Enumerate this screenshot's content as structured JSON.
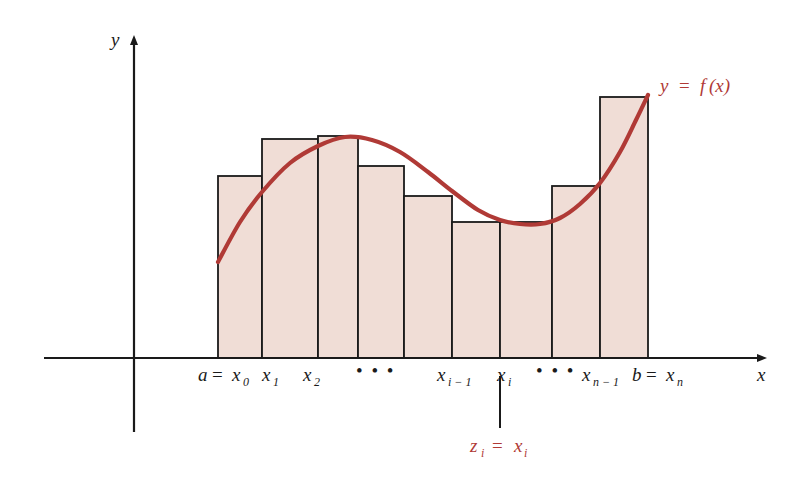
{
  "figure": {
    "axis_labels": {
      "x": "x",
      "y": "y"
    },
    "curve_label": {
      "y": "y",
      "equals": "=",
      "f": "f",
      "arg": "(x)"
    },
    "sample_point_label": {
      "z": "z",
      "z_sub": "i",
      "equals": "=",
      "x": "x",
      "x_sub": "i"
    },
    "tick_labels": [
      {
        "name": "a-equals-x0",
        "main": "a",
        "op": "=",
        "var": "x",
        "sub": "0",
        "x": 198
      },
      {
        "name": "x1",
        "main": "",
        "op": "",
        "var": "x",
        "sub": "1",
        "x": 262
      },
      {
        "name": "x2",
        "main": "",
        "op": "",
        "var": "x",
        "sub": "2",
        "x": 303
      },
      {
        "name": "ellipsis-left",
        "main": "",
        "op": "",
        "var": "",
        "sub": "",
        "x": 356
      },
      {
        "name": "xi-minus-1",
        "main": "",
        "op": "",
        "var": "x",
        "sub": "i − 1",
        "x": 437
      },
      {
        "name": "xi",
        "main": "",
        "op": "",
        "var": "x",
        "sub": "i",
        "x": 497
      },
      {
        "name": "ellipsis-right",
        "main": "",
        "op": "",
        "var": "",
        "sub": "",
        "x": 536
      },
      {
        "name": "xn-minus-1",
        "main": "",
        "op": "",
        "var": "x",
        "sub": "n − 1",
        "x": 582
      },
      {
        "name": "b-equals-xn",
        "main": "b",
        "op": "=",
        "var": "x",
        "sub": "n",
        "x": 632
      }
    ],
    "ellipsis_dots": "• • •",
    "colors": {
      "curve": "#b03a36",
      "rectangle_fill": "#f0ddd6",
      "rectangle_stroke": "#1a1a1a",
      "axis": "#1a1a1a",
      "annotation": "#b03a36"
    }
  },
  "chart_data": {
    "type": "bar",
    "title": "",
    "subtitle": "",
    "xlabel": "x",
    "ylabel": "y",
    "grid": false,
    "legend": null,
    "axis_origin": {
      "x": 134,
      "y": 358
    },
    "xlim": [
      134,
      770
    ],
    "ylim": [
      358,
      40
    ],
    "categories": [
      "x0 to x1",
      "x1 to x2",
      "x2 to x3",
      "x3 to x4",
      "x4 to x5",
      "xi-1 to xi",
      "xi to xi+1",
      "xn-2 to xn-1",
      "xn-1 to xn"
    ],
    "bars": [
      {
        "x0": 218,
        "x1": 262,
        "top": 176
      },
      {
        "x0": 262,
        "x1": 318,
        "top": 139
      },
      {
        "x0": 318,
        "x1": 358,
        "top": 136
      },
      {
        "x0": 358,
        "x1": 404,
        "top": 166
      },
      {
        "x0": 404,
        "x1": 452,
        "top": 196
      },
      {
        "x0": 452,
        "x1": 500,
        "top": 222
      },
      {
        "x0": 500,
        "x1": 552,
        "top": 222
      },
      {
        "x0": 552,
        "x1": 600,
        "top": 186
      },
      {
        "x0": 600,
        "x1": 648,
        "top": 97
      }
    ],
    "values": [
      182,
      219,
      222,
      192,
      162,
      136,
      136,
      172,
      261
    ],
    "baseline": 358,
    "curve": {
      "name": "y = f(x)",
      "color": "#b03a36",
      "points": [
        [
          218,
          262
        ],
        [
          240,
          222
        ],
        [
          262,
          192
        ],
        [
          290,
          163
        ],
        [
          318,
          146
        ],
        [
          345,
          137
        ],
        [
          372,
          140
        ],
        [
          400,
          152
        ],
        [
          428,
          172
        ],
        [
          452,
          191
        ],
        [
          478,
          210
        ],
        [
          500,
          220
        ],
        [
          520,
          224
        ],
        [
          540,
          224
        ],
        [
          560,
          218
        ],
        [
          580,
          204
        ],
        [
          600,
          183
        ],
        [
          620,
          152
        ],
        [
          636,
          120
        ],
        [
          648,
          95
        ]
      ]
    },
    "sample_point": {
      "x": 500,
      "label": "z_i = x_i"
    }
  }
}
